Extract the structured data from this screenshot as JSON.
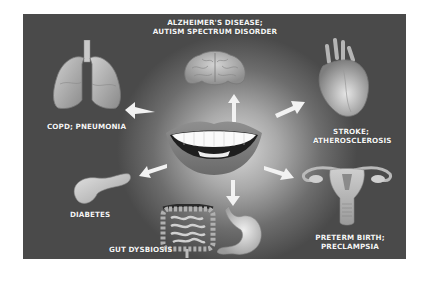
{
  "center": {
    "name": "mouth",
    "icon": "smiling-mouth-teeth"
  },
  "colors": {
    "panel_dark": "#4a4a4a",
    "panel_glow": "#d8d8d8",
    "label_text": "#f4f4f4",
    "page_bg": "#ffffff"
  },
  "nodes": [
    {
      "id": "brain",
      "icon": "brain-icon",
      "label_line1": "ALZHEIMER'S DISEASE;",
      "label_line2": "AUTISM SPECTRUM DISORDER"
    },
    {
      "id": "lungs",
      "icon": "lungs-icon",
      "label_line1": "COPD; PNEUMONIA",
      "label_line2": ""
    },
    {
      "id": "heart",
      "icon": "heart-icon",
      "label_line1": "STROKE;",
      "label_line2": "ATHEROSCLEROSIS"
    },
    {
      "id": "pancreas",
      "icon": "pancreas-icon",
      "label_line1": "DIABETES",
      "label_line2": ""
    },
    {
      "id": "gut",
      "icon": "intestines-stomach-icon",
      "label_line1": "GUT DYSBIOSIS",
      "label_line2": ""
    },
    {
      "id": "uterus",
      "icon": "uterus-icon",
      "label_line1": "PRETERM BIRTH;",
      "label_line2": "PRECLAMPSIA"
    }
  ]
}
